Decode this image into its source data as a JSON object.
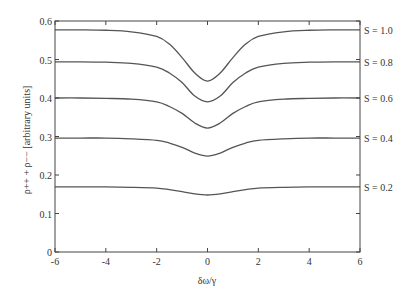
{
  "chart_data": {
    "type": "line",
    "title": "",
    "xlabel": "δω/γ",
    "ylabel": "ρ++ + ρ−− [arbitrary units]",
    "xlim": [
      -6,
      6
    ],
    "ylim": [
      0,
      0.6
    ],
    "xticks": [
      -6,
      -4,
      -2,
      0,
      2,
      4,
      6
    ],
    "xtick_labels": [
      "-6",
      "-4",
      "-2",
      "0",
      "2",
      "4",
      "6"
    ],
    "yticks": [
      0,
      0.1,
      0.2,
      0.3,
      0.4,
      0.5,
      0.6
    ],
    "ytick_labels": [
      "0",
      "0.1",
      "0.2",
      "0.3",
      "0.4",
      "0.5",
      "0.6"
    ],
    "grid": false,
    "legend_position": "right-inline labels",
    "x": [
      -6,
      -5,
      -4,
      -3,
      -2,
      -1.5,
      -1,
      -0.5,
      0,
      0.5,
      1,
      1.5,
      2,
      3,
      4,
      5,
      6
    ],
    "series": [
      {
        "name": "S = 1.0",
        "values": [
          0.577,
          0.577,
          0.576,
          0.572,
          0.56,
          0.54,
          0.505,
          0.465,
          0.444,
          0.465,
          0.505,
          0.54,
          0.56,
          0.572,
          0.576,
          0.577,
          0.577
        ]
      },
      {
        "name": "S = 0.8",
        "values": [
          0.494,
          0.494,
          0.493,
          0.49,
          0.48,
          0.465,
          0.44,
          0.405,
          0.39,
          0.405,
          0.44,
          0.465,
          0.48,
          0.49,
          0.493,
          0.494,
          0.494
        ]
      },
      {
        "name": "S = 0.6",
        "values": [
          0.4,
          0.4,
          0.399,
          0.397,
          0.39,
          0.378,
          0.36,
          0.335,
          0.322,
          0.335,
          0.36,
          0.378,
          0.39,
          0.397,
          0.399,
          0.4,
          0.4
        ]
      },
      {
        "name": "S = 0.4",
        "values": [
          0.296,
          0.296,
          0.296,
          0.294,
          0.29,
          0.283,
          0.272,
          0.257,
          0.249,
          0.257,
          0.272,
          0.283,
          0.29,
          0.294,
          0.296,
          0.296,
          0.296
        ]
      },
      {
        "name": "S = 0.2",
        "values": [
          0.169,
          0.169,
          0.169,
          0.168,
          0.166,
          0.162,
          0.157,
          0.151,
          0.148,
          0.151,
          0.157,
          0.162,
          0.166,
          0.168,
          0.169,
          0.169,
          0.169
        ]
      }
    ]
  },
  "colors": {
    "axis": "#444444",
    "line": "#555555",
    "text": "#333333"
  }
}
